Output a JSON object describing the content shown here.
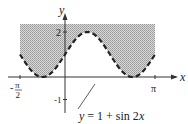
{
  "figure": {
    "type": "region-graph",
    "axes": {
      "x_label": "x",
      "y_label": "y",
      "x_ticks": [
        {
          "label_num": "π",
          "label_den": "2",
          "sign": "-",
          "value": "-π/2"
        },
        {
          "label": "π",
          "value": "π"
        }
      ],
      "y_ticks": [
        {
          "label": "2",
          "value": 2
        },
        {
          "label": "-1",
          "value": -1
        }
      ]
    },
    "curve": {
      "equation_label": "y = 1 + sin 2x",
      "lhs": "y",
      "rhs_prefix": "= 1 + sin 2",
      "rhs_var": "x",
      "style": "dashed",
      "color": "#222222"
    },
    "region": {
      "description": "shaded region between curve and y = 2.5, from x = -π/2 to x = π",
      "fill": "#bdbdbd",
      "x_range": [
        "-π/2",
        "π"
      ],
      "top": 2.5
    }
  }
}
